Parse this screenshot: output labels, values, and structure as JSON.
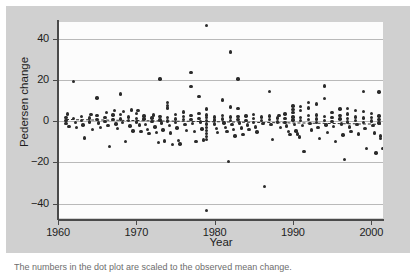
{
  "figure": {
    "caption_partial": "The numbers in the dot plot are scaled to the observed mean change.",
    "background_color": "#d0d0d0",
    "plot_background_color": "#fcfcfc",
    "point_color": "#2b2b2b",
    "gridline_color": "#b9b9b9",
    "axis_color": "#4a4a4a"
  },
  "chart_data": {
    "type": "scatter",
    "title": "",
    "xlabel": "Year",
    "ylabel": "Pedersen change",
    "xlim": [
      1960.0,
      2001.5
    ],
    "ylim": [
      -47,
      48
    ],
    "xticks": [
      1960,
      1970,
      1980,
      1990,
      2000
    ],
    "xtick_labels": [
      "1960",
      "1970",
      "1980",
      "1990",
      "2000"
    ],
    "yticks": [
      -40,
      -20,
      0,
      20,
      40
    ],
    "ytick_labels": [
      "-40",
      "-20",
      "0",
      "20",
      "40"
    ],
    "grid": "horizontal",
    "legend": "none",
    "trendline": {
      "style": "dashed",
      "x_start": 1961.0,
      "x_end": 2001.2,
      "y_start": 1.1,
      "y_end": -1.2
    },
    "series": [
      {
        "name": "Pedersen change",
        "marker": "filled-circle",
        "points": [
          [
            1961.0,
            1.8
          ],
          [
            1961.0,
            0.4
          ],
          [
            1961.0,
            -1.2
          ],
          [
            1961.2,
            3.4
          ],
          [
            1961.4,
            -2.6
          ],
          [
            1962.0,
            19.2
          ],
          [
            1962.0,
            1.1
          ],
          [
            1962.2,
            -0.6
          ],
          [
            1962.4,
            -3.2
          ],
          [
            1963.0,
            2.2
          ],
          [
            1963.0,
            0.2
          ],
          [
            1963.2,
            -1.9
          ],
          [
            1963.4,
            -8.2
          ],
          [
            1964.0,
            1.4
          ],
          [
            1964.0,
            -0.5
          ],
          [
            1964.2,
            3.1
          ],
          [
            1964.4,
            -4.2
          ],
          [
            1965.0,
            11.2
          ],
          [
            1965.0,
            2.6
          ],
          [
            1965.0,
            0.8
          ],
          [
            1965.2,
            -0.9
          ],
          [
            1965.4,
            -3.0
          ],
          [
            1966.0,
            1.7
          ],
          [
            1966.0,
            -0.2
          ],
          [
            1966.2,
            4.0
          ],
          [
            1966.4,
            -2.1
          ],
          [
            1966.6,
            -12.2
          ],
          [
            1967.0,
            2.9
          ],
          [
            1967.0,
            0.6
          ],
          [
            1967.2,
            5.1
          ],
          [
            1967.4,
            -1.4
          ],
          [
            1967.6,
            -3.6
          ],
          [
            1968.0,
            13.2
          ],
          [
            1968.0,
            3.3
          ],
          [
            1968.0,
            1.0
          ],
          [
            1968.2,
            -0.8
          ],
          [
            1968.4,
            4.6
          ],
          [
            1968.6,
            -9.8
          ],
          [
            1969.0,
            2.0
          ],
          [
            1969.0,
            0.3
          ],
          [
            1969.2,
            -2.4
          ],
          [
            1969.4,
            5.4
          ],
          [
            1969.6,
            -4.8
          ],
          [
            1970.0,
            3.8
          ],
          [
            1970.0,
            1.2
          ],
          [
            1970.0,
            -0.4
          ],
          [
            1970.2,
            5.0
          ],
          [
            1970.4,
            -2.0
          ],
          [
            1970.6,
            -5.2
          ],
          [
            1971.0,
            2.4
          ],
          [
            1971.0,
            0.9
          ],
          [
            1971.2,
            -1.6
          ],
          [
            1971.4,
            -4.0
          ],
          [
            1971.6,
            -6.1
          ],
          [
            1972.0,
            1.5
          ],
          [
            1972.0,
            -0.3
          ],
          [
            1972.2,
            3.0
          ],
          [
            1972.4,
            -2.8
          ],
          [
            1972.6,
            -5.5
          ],
          [
            1972.8,
            -10.4
          ],
          [
            1973.0,
            20.4
          ],
          [
            1973.0,
            2.1
          ],
          [
            1973.0,
            0.5
          ],
          [
            1973.2,
            -1.0
          ],
          [
            1973.4,
            -4.4
          ],
          [
            1973.6,
            -9.6
          ],
          [
            1974.0,
            8.9
          ],
          [
            1974.0,
            7.6
          ],
          [
            1974.0,
            6.4
          ],
          [
            1974.0,
            1.8
          ],
          [
            1974.0,
            0.1
          ],
          [
            1974.2,
            -2.2
          ],
          [
            1974.4,
            -5.8
          ],
          [
            1974.6,
            -11.3
          ],
          [
            1975.0,
            3.2
          ],
          [
            1975.0,
            1.0
          ],
          [
            1975.0,
            -0.7
          ],
          [
            1975.2,
            -3.4
          ],
          [
            1975.4,
            -9.4
          ],
          [
            1975.6,
            -11.2
          ],
          [
            1976.0,
            4.4
          ],
          [
            1976.0,
            2.3
          ],
          [
            1976.0,
            0.6
          ],
          [
            1976.2,
            -1.8
          ],
          [
            1976.4,
            -4.6
          ],
          [
            1977.0,
            23.6
          ],
          [
            1977.0,
            16.7
          ],
          [
            1977.0,
            2.8
          ],
          [
            1977.0,
            0.8
          ],
          [
            1977.2,
            -1.1
          ],
          [
            1977.4,
            -5.0
          ],
          [
            1977.6,
            -9.8
          ],
          [
            1978.0,
            12.0
          ],
          [
            1978.0,
            3.6
          ],
          [
            1978.0,
            1.3
          ],
          [
            1978.2,
            -0.5
          ],
          [
            1978.4,
            -3.8
          ],
          [
            1978.6,
            -9.2
          ],
          [
            1979.0,
            46.2
          ],
          [
            1979.0,
            5.8
          ],
          [
            1979.0,
            3.0
          ],
          [
            1979.0,
            1.6
          ],
          [
            1979.0,
            0.2
          ],
          [
            1979.0,
            -1.5
          ],
          [
            1979.0,
            -3.1
          ],
          [
            1979.0,
            -4.6
          ],
          [
            1979.0,
            -6.0
          ],
          [
            1979.0,
            -7.5
          ],
          [
            1979.0,
            -9.0
          ],
          [
            1979.0,
            -43.4
          ],
          [
            1980.0,
            2.0
          ],
          [
            1980.0,
            0.5
          ],
          [
            1980.0,
            -1.4
          ],
          [
            1980.2,
            -3.5
          ],
          [
            1980.4,
            -5.6
          ],
          [
            1981.0,
            10.2
          ],
          [
            1981.0,
            2.6
          ],
          [
            1981.0,
            0.9
          ],
          [
            1981.2,
            -0.9
          ],
          [
            1981.4,
            -3.0
          ],
          [
            1981.6,
            -5.2
          ],
          [
            1981.8,
            -19.6
          ],
          [
            1982.0,
            33.4
          ],
          [
            1982.0,
            6.8
          ],
          [
            1982.0,
            1.9
          ],
          [
            1982.0,
            0.3
          ],
          [
            1982.2,
            -1.7
          ],
          [
            1982.4,
            -4.2
          ],
          [
            1982.6,
            -7.2
          ],
          [
            1983.0,
            20.4
          ],
          [
            1983.0,
            6.0
          ],
          [
            1983.0,
            2.2
          ],
          [
            1983.0,
            0.7
          ],
          [
            1983.2,
            -1.0
          ],
          [
            1983.4,
            -3.4
          ],
          [
            1983.6,
            -6.6
          ],
          [
            1984.0,
            2.5
          ],
          [
            1984.0,
            0.4
          ],
          [
            1984.2,
            -2.0
          ],
          [
            1984.4,
            -4.0
          ],
          [
            1985.0,
            3.1
          ],
          [
            1985.0,
            1.1
          ],
          [
            1985.0,
            -0.6
          ],
          [
            1985.2,
            -2.8
          ],
          [
            1985.4,
            -5.4
          ],
          [
            1986.0,
            2.0
          ],
          [
            1986.0,
            0.2
          ],
          [
            1986.2,
            -1.3
          ],
          [
            1986.4,
            -31.8
          ],
          [
            1987.0,
            14.2
          ],
          [
            1987.0,
            2.4
          ],
          [
            1987.0,
            0.6
          ],
          [
            1987.2,
            -1.8
          ],
          [
            1987.4,
            -8.9
          ],
          [
            1988.0,
            1.5
          ],
          [
            1988.0,
            -0.4
          ],
          [
            1988.2,
            2.8
          ],
          [
            1988.4,
            -3.2
          ],
          [
            1989.0,
            3.4
          ],
          [
            1989.0,
            1.2
          ],
          [
            1989.0,
            -0.8
          ],
          [
            1989.2,
            -2.4
          ],
          [
            1989.4,
            -5.0
          ],
          [
            1989.6,
            -6.5
          ],
          [
            1990.0,
            7.2
          ],
          [
            1990.0,
            5.6
          ],
          [
            1990.0,
            4.1
          ],
          [
            1990.0,
            2.0
          ],
          [
            1990.0,
            0.5
          ],
          [
            1990.2,
            -1.6
          ],
          [
            1990.4,
            -4.8
          ],
          [
            1990.6,
            -6.2
          ],
          [
            1990.8,
            -7.8
          ],
          [
            1991.0,
            7.0
          ],
          [
            1991.0,
            5.2
          ],
          [
            1991.0,
            1.8
          ],
          [
            1991.0,
            0.2
          ],
          [
            1991.2,
            -2.2
          ],
          [
            1991.4,
            -14.8
          ],
          [
            1992.0,
            9.0
          ],
          [
            1992.0,
            6.4
          ],
          [
            1992.0,
            2.6
          ],
          [
            1992.0,
            0.8
          ],
          [
            1992.2,
            -1.2
          ],
          [
            1992.4,
            -4.4
          ],
          [
            1993.0,
            8.3
          ],
          [
            1993.0,
            3.0
          ],
          [
            1993.0,
            1.0
          ],
          [
            1993.0,
            -0.6
          ],
          [
            1993.2,
            -3.0
          ],
          [
            1993.4,
            -8.6
          ],
          [
            1994.0,
            17.0
          ],
          [
            1994.0,
            11.0
          ],
          [
            1994.0,
            2.2
          ],
          [
            1994.0,
            0.4
          ],
          [
            1994.2,
            -1.9
          ],
          [
            1994.4,
            -5.6
          ],
          [
            1995.0,
            4.0
          ],
          [
            1995.0,
            1.6
          ],
          [
            1995.0,
            -0.3
          ],
          [
            1995.2,
            -2.6
          ],
          [
            1995.4,
            -10.0
          ],
          [
            1996.0,
            5.8
          ],
          [
            1996.0,
            2.8
          ],
          [
            1996.0,
            0.9
          ],
          [
            1996.2,
            -1.5
          ],
          [
            1996.4,
            -6.8
          ],
          [
            1996.6,
            -18.6
          ],
          [
            1997.0,
            6.2
          ],
          [
            1997.0,
            3.4
          ],
          [
            1997.0,
            1.1
          ],
          [
            1997.0,
            -0.5
          ],
          [
            1997.2,
            -2.9
          ],
          [
            1997.4,
            -5.2
          ],
          [
            1998.0,
            5.0
          ],
          [
            1998.0,
            2.0
          ],
          [
            1998.0,
            0.3
          ],
          [
            1998.2,
            -1.8
          ],
          [
            1998.4,
            -6.2
          ],
          [
            1999.0,
            14.2
          ],
          [
            1999.0,
            4.6
          ],
          [
            1999.0,
            1.4
          ],
          [
            1999.0,
            -0.7
          ],
          [
            1999.2,
            -3.6
          ],
          [
            1999.4,
            -13.2
          ],
          [
            2000.0,
            3.8
          ],
          [
            2000.0,
            1.8
          ],
          [
            2000.0,
            0.1
          ],
          [
            2000.2,
            -2.2
          ],
          [
            2000.4,
            -5.8
          ],
          [
            2000.6,
            -15.4
          ],
          [
            2001.0,
            14.0
          ],
          [
            2001.0,
            2.4
          ],
          [
            2001.0,
            0.6
          ],
          [
            2001.0,
            -1.0
          ],
          [
            2001.2,
            -7.2
          ],
          [
            2001.2,
            -8.4
          ],
          [
            2001.4,
            -13.4
          ]
        ]
      }
    ]
  }
}
